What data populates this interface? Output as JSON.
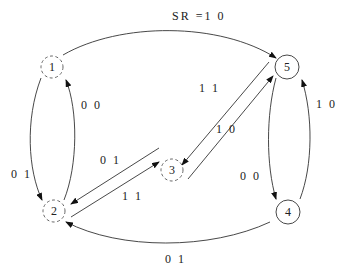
{
  "diagram": {
    "type": "state-transition",
    "nodes": [
      {
        "id": "1",
        "label": "1",
        "style": "dashed",
        "cx": 52,
        "cy": 67
      },
      {
        "id": "2",
        "label": "2",
        "style": "dashed",
        "cx": 54,
        "cy": 211
      },
      {
        "id": "3",
        "label": "3",
        "style": "dashed",
        "cx": 172,
        "cy": 170
      },
      {
        "id": "4",
        "label": "4",
        "style": "solid",
        "cx": 288,
        "cy": 212
      },
      {
        "id": "5",
        "label": "5",
        "style": "solid",
        "cx": 287,
        "cy": 67
      }
    ],
    "edges": [
      {
        "from": "1",
        "to": "5",
        "label": "SR =1 0"
      },
      {
        "from": "1",
        "to": "2",
        "label": "0 1"
      },
      {
        "from": "2",
        "to": "1",
        "label": "0 0"
      },
      {
        "from": "5",
        "to": "3",
        "label": "1 1"
      },
      {
        "from": "3",
        "to": "5",
        "label": "1 0"
      },
      {
        "from": "3",
        "to": "2",
        "label": "0 1"
      },
      {
        "from": "2",
        "to": "3",
        "label": "1 1"
      },
      {
        "from": "5",
        "to": "4",
        "label": "0 0"
      },
      {
        "from": "4",
        "to": "5",
        "label": "1 0"
      },
      {
        "from": "4",
        "to": "2",
        "label": "0 1"
      }
    ]
  }
}
